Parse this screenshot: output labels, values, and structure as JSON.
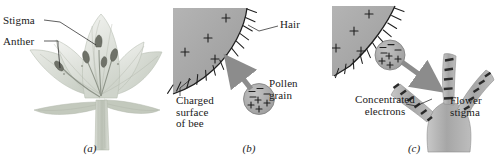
{
  "figure": {
    "background_color": "#ffffff",
    "ink_color": "#1a1a1a",
    "gray_fill": "#a8a8a8",
    "arrow_color": "#8c8c8c",
    "flower_color": "#c9cfc4"
  },
  "panels": [
    {
      "id": "a",
      "caption": "(a)",
      "labels": [
        {
          "name": "stigma",
          "text": "Stigma"
        },
        {
          "name": "anther",
          "text": "Anther"
        }
      ]
    },
    {
      "id": "b",
      "caption": "(b)",
      "labels": [
        {
          "name": "hair",
          "text": "Hair"
        },
        {
          "name": "pollen-grain",
          "text": "Pollen\ngrain"
        },
        {
          "name": "charged-surface-of-bee",
          "text": "Charged\nsurface\nof bee"
        }
      ]
    },
    {
      "id": "c",
      "caption": "(c)",
      "labels": [
        {
          "name": "concentrated-electrons",
          "text": "Concentrated\nelectrons"
        },
        {
          "name": "flower-stigma",
          "text": "Flower\nstigma"
        }
      ]
    }
  ],
  "symbols": {
    "plus": "+",
    "minus": "–",
    "bee_surface_plus_count": 4,
    "pollen_minus_count": 4,
    "pollen_plus_count": 4
  }
}
